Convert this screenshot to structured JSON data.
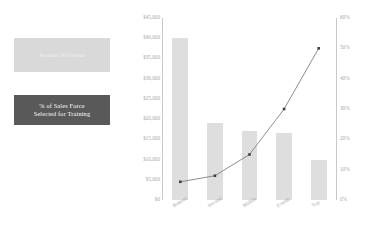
{
  "legend": {
    "revenue": {
      "label": "Annual Revenue",
      "color": "#d9d9d9",
      "text_color": "#eeeeee"
    },
    "training": {
      "line1": "% of Sales Force",
      "line2": "Selected for Training",
      "color": "#595959",
      "text_color": "#ffffff"
    }
  },
  "chart_data": {
    "type": "bar",
    "title": "",
    "xlabel": "",
    "categories": [
      "Bottom",
      "Second",
      "Middle",
      "Fourth",
      "Top"
    ],
    "grid": false,
    "legend_position": "left",
    "series": [
      {
        "name": "Annual Revenue",
        "type": "bar",
        "axis": "left",
        "color": "#dedede",
        "values": [
          40000,
          19000,
          17000,
          16500,
          10000
        ]
      },
      {
        "name": "% of Sales Force Selected for Training",
        "type": "line",
        "axis": "right",
        "color": "#808080",
        "marker_color": "#404040",
        "values": [
          6,
          8,
          15,
          30,
          50
        ]
      }
    ],
    "left_axis": {
      "ylabel": "",
      "ylim": [
        0,
        45000
      ],
      "ticks": [
        0,
        5000,
        10000,
        15000,
        20000,
        25000,
        30000,
        35000,
        40000,
        45000
      ],
      "tick_labels": [
        "$0",
        "$5,000",
        "$10,000",
        "$15,000",
        "$20,000",
        "$25,000",
        "$30,000",
        "$35,000",
        "$40,000",
        "$45,000"
      ]
    },
    "right_axis": {
      "ylabel": "",
      "ylim": [
        0,
        60
      ],
      "ticks": [
        0,
        10,
        20,
        30,
        40,
        50,
        60
      ],
      "tick_labels": [
        "0%",
        "10%",
        "20%",
        "30%",
        "40%",
        "50%",
        "60%"
      ]
    }
  }
}
